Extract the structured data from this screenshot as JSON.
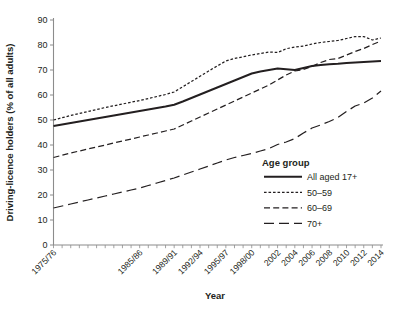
{
  "chart_data": {
    "type": "line",
    "title": "",
    "xlabel": "Year",
    "ylabel": "Driving-licence holders (% of all adults)",
    "ylim": [
      0,
      90
    ],
    "ytick_step": 10,
    "yticks": [
      0,
      10,
      20,
      30,
      40,
      50,
      60,
      70,
      80,
      90
    ],
    "grid": false,
    "legend_position": "inside-right-lower",
    "legend_title": "Age group",
    "x": [
      "1975/76",
      "1976/77",
      "1977/78",
      "1978/79",
      "1979/80",
      "1980/81",
      "1981/82",
      "1982/83",
      "1983/84",
      "1984/85",
      "1985/86",
      "1986/87",
      "1987/88",
      "1988/89",
      "1989/91",
      "1990/92",
      "1991/93",
      "1992/94",
      "1993/95",
      "1994/96",
      "1995/97",
      "1996/98",
      "1997/99",
      "1998/00",
      "1999/01",
      "2000/02",
      "2002",
      "2003",
      "2004",
      "2005",
      "2006",
      "2007",
      "2008",
      "2009",
      "2010",
      "2011",
      "2012",
      "2013",
      "2014"
    ],
    "xtick_labels": [
      "1975/76",
      "1985/86",
      "1989/91",
      "1992/94",
      "1995/97",
      "1998/00",
      "2002",
      "2004",
      "2006",
      "2008",
      "2010",
      "2012",
      "2014"
    ],
    "xtick_label_indices": [
      0,
      10,
      14,
      17,
      20,
      23,
      26,
      28,
      30,
      32,
      34,
      36,
      38
    ],
    "series": [
      {
        "name": "All aged 17+",
        "style": "solid",
        "values": [
          47.6,
          48.2,
          48.8,
          49.4,
          50.0,
          50.6,
          51.2,
          51.8,
          52.4,
          53.0,
          53.6,
          54.2,
          54.8,
          55.4,
          56.1,
          57.4,
          58.8,
          60.2,
          61.6,
          63.0,
          64.4,
          65.8,
          67.2,
          68.6,
          69.4,
          70.0,
          70.6,
          70.3,
          70.0,
          70.8,
          71.6,
          72.0,
          72.3,
          72.5,
          72.8,
          73.0,
          73.2,
          73.4,
          73.6
        ]
      },
      {
        "name": "50–59",
        "style": "dotted",
        "values": [
          50.0,
          50.9,
          51.8,
          52.6,
          53.4,
          54.2,
          55.0,
          55.7,
          56.4,
          57.1,
          57.8,
          58.6,
          59.4,
          60.2,
          61.2,
          63.3,
          65.4,
          67.5,
          69.6,
          71.6,
          73.6,
          74.6,
          75.3,
          76.0,
          76.6,
          77.2,
          77.0,
          78.5,
          79.2,
          79.6,
          80.4,
          81.0,
          81.4,
          81.8,
          82.6,
          83.4,
          83.4,
          82.0,
          82.8
        ]
      },
      {
        "name": "60–69",
        "style": "dashed",
        "values": [
          35.0,
          35.9,
          36.8,
          37.6,
          38.4,
          39.2,
          40.0,
          40.8,
          41.6,
          42.4,
          43.2,
          44.0,
          44.8,
          45.6,
          46.4,
          48.0,
          49.6,
          51.2,
          52.8,
          54.4,
          56.0,
          57.6,
          59.2,
          60.8,
          62.4,
          64.0,
          66.0,
          68.0,
          69.6,
          70.2,
          71.4,
          73.0,
          74.2,
          74.6,
          76.0,
          77.4,
          78.6,
          80.2,
          81.6
        ]
      },
      {
        "name": "70+",
        "style": "longdash",
        "values": [
          14.8,
          15.6,
          16.4,
          17.2,
          18.0,
          18.8,
          19.6,
          20.4,
          21.2,
          22.0,
          22.8,
          23.8,
          24.8,
          25.8,
          26.8,
          28.0,
          29.2,
          30.4,
          31.6,
          32.8,
          34.0,
          35.0,
          35.8,
          36.6,
          37.6,
          38.6,
          40.2,
          41.2,
          42.6,
          44.8,
          46.8,
          48.0,
          49.4,
          51.0,
          53.4,
          55.6,
          56.8,
          58.8,
          61.6
        ]
      }
    ]
  },
  "axis": {
    "ylabel": "Driving-licence holders (% of all adults)",
    "xlabel": "Year"
  },
  "legend": {
    "title": "Age group",
    "items": [
      {
        "label": "All aged 17+",
        "style": "solid"
      },
      {
        "label": "50–59",
        "style": "dotted"
      },
      {
        "label": "60–69",
        "style": "dashed"
      },
      {
        "label": "70+",
        "style": "longdash"
      }
    ]
  }
}
